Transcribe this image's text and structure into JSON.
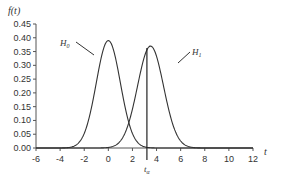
{
  "chart_data": {
    "type": "line",
    "title": "",
    "xlabel": "t",
    "ylabel": "f(t)",
    "xlim": [
      -6,
      12
    ],
    "ylim": [
      0,
      0.45
    ],
    "x_ticks": [
      "-6",
      "-4",
      "-2",
      "0",
      "2",
      "4",
      "6",
      "8",
      "10",
      "12"
    ],
    "y_ticks": [
      "0.00",
      "0.05",
      "0.10",
      "0.15",
      "0.20",
      "0.25",
      "0.30",
      "0.35",
      "0.40",
      "0.45"
    ],
    "grid": false,
    "series": [
      {
        "name": "H0",
        "distribution": "normal",
        "mean": 0,
        "sd": 1.0,
        "peak": 0.39
      },
      {
        "name": "H1",
        "distribution": "normal",
        "mean": 3.5,
        "sd": 1.08,
        "peak": 0.37
      }
    ],
    "annotations": [
      {
        "text": "H0",
        "x": -2.2,
        "y": 0.37
      },
      {
        "text": "H1",
        "x": 6.0,
        "y": 0.34
      },
      {
        "text": "t_α",
        "type": "vertical-line",
        "x": 3.2
      }
    ]
  },
  "labels": {
    "ylabel": "f(t)",
    "xlabel": "t",
    "h0": "H",
    "h0_sub": "0",
    "h1": "H",
    "h1_sub": "1",
    "talpha": "t",
    "talpha_sub": "α"
  }
}
